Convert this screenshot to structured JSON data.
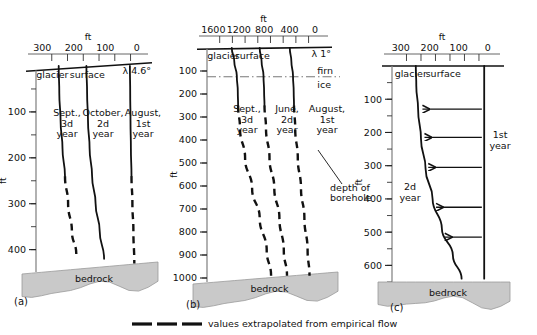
{
  "figure": {
    "legend": {
      "dash_symbol": "— — —",
      "text": "values extrapolated from empirical flow"
    },
    "panels": [
      {
        "id": "a",
        "caption": "(a)",
        "axis_unit_top": "ft",
        "axis_unit_left": "ft",
        "x_ticks": [
          "300",
          "200",
          "100",
          "0"
        ],
        "x_minor_step": 50,
        "y_ticks": [
          "100",
          "200",
          "300",
          "400"
        ],
        "y_minor_step": 50,
        "surface_label_left": "glacier",
        "surface_label_right": "surface",
        "slope_label": "λ 4.6°",
        "bed_label": "bedrock",
        "curves": [
          {
            "name": "curve-3d-year",
            "label_lines": [
              "Sept.,",
              "3d",
              "year"
            ],
            "solid_to_depth": 260,
            "extrapolated": true
          },
          {
            "name": "curve-2d-year",
            "label_lines": [
              "October,",
              "2d",
              "year"
            ],
            "solid_to_depth": 420,
            "extrapolated": false
          },
          {
            "name": "curve-1st-year",
            "label_lines": [
              "August,",
              "1st",
              "year"
            ],
            "solid_to_depth": 240,
            "extrapolated": true
          }
        ]
      },
      {
        "id": "b",
        "caption": "(b)",
        "axis_unit_top": "ft",
        "axis_unit_left": "ft",
        "x_ticks": [
          "1600",
          "1200",
          "800",
          "400",
          "0"
        ],
        "x_minor_step": 200,
        "y_ticks": [
          "100",
          "200",
          "300",
          "400",
          "500",
          "600",
          "700",
          "800",
          "900",
          "1000"
        ],
        "y_minor_step": 100,
        "surface_label_left": "glacier",
        "surface_label_right": "surface",
        "slope_label": "λ 1°",
        "firn_label": "firn",
        "ice_label": "ice",
        "firn_ice_depth": 125,
        "bed_label": "bedrock",
        "annotation": {
          "name": "depth-of-borehole",
          "lines": [
            "depth of",
            "borehole"
          ]
        },
        "curves": [
          {
            "name": "curve-3d-year",
            "label_lines": [
              "Sept.,",
              "3d",
              "year"
            ],
            "solid_to_depth": 250,
            "extrapolated": true
          },
          {
            "name": "curve-2d-year",
            "label_lines": [
              "June,",
              "2d",
              "year"
            ],
            "solid_to_depth": 250,
            "extrapolated": true
          },
          {
            "name": "curve-1st-year",
            "label_lines": [
              "August,",
              "1st",
              "year"
            ],
            "solid_to_depth": 250,
            "extrapolated": true
          }
        ]
      },
      {
        "id": "c",
        "caption": "(c)",
        "axis_unit_top": "ft",
        "axis_unit_left": "ft",
        "x_ticks": [
          "300",
          "200",
          "100",
          "0"
        ],
        "x_minor_step": 50,
        "y_ticks": [
          "100",
          "200",
          "300",
          "400",
          "500",
          "600"
        ],
        "y_minor_step": 50,
        "surface_label_left": "glacier",
        "surface_label_right": "surface",
        "bed_label": "bedrock",
        "arrow_count": 5,
        "curves": [
          {
            "name": "curve-2d-year",
            "label_lines": [
              "2d",
              "year"
            ],
            "solid_to_depth": 650,
            "extrapolated": false
          },
          {
            "name": "curve-1st-year",
            "label_lines": [
              "1st",
              "year"
            ],
            "solid_to_depth": 650,
            "extrapolated": false
          }
        ]
      }
    ]
  },
  "chart_data": {
    "type": "line",
    "title": "",
    "xlabel": "ft",
    "ylabel": "ft",
    "grid": false,
    "legend": "values extrapolated from empirical flow",
    "panels": [
      {
        "panel": "a",
        "xlim": [
          320,
          -10
        ],
        "ylim": [
          0,
          440
        ],
        "xticks": [
          300,
          200,
          100,
          0
        ],
        "yticks": [
          100,
          200,
          300,
          400
        ],
        "surface_slope_deg": 4.6,
        "bed_depth": 440,
        "series": [
          {
            "name": "Sept., 3d year",
            "x": [
              248,
              246,
              242,
              236,
              228,
              218,
              206,
              192
            ],
            "y": [
              0,
              60,
              120,
              180,
              240,
              300,
              360,
              410
            ],
            "dashed_from_y": 260
          },
          {
            "name": "October, 2d year",
            "x": [
              160,
              158,
              155,
              150,
              142,
              131,
              118,
              104
            ],
            "y": [
              0,
              60,
              120,
              180,
              240,
              300,
              360,
              420
            ],
            "dashed_from_y": null
          },
          {
            "name": "August, 1st year",
            "x": [
              22,
              21,
              20,
              19,
              17,
              14,
              11,
              8
            ],
            "y": [
              0,
              60,
              120,
              180,
              240,
              300,
              360,
              430
            ],
            "dashed_from_y": 240
          }
        ]
      },
      {
        "panel": "b",
        "xlim": [
          1700,
          -80
        ],
        "ylim": [
          0,
          1000
        ],
        "xticks": [
          1600,
          1200,
          800,
          400,
          0
        ],
        "yticks": [
          100,
          200,
          300,
          400,
          500,
          600,
          700,
          800,
          900,
          1000
        ],
        "surface_slope_deg": 1.0,
        "firn_ice_boundary_depth": 125,
        "bed_depth": 1000,
        "series": [
          {
            "name": "Sept., 3d year",
            "x": [
              1310,
              1270,
              1230,
              1215,
              1210,
              1180,
              1100,
              990,
              870,
              760,
              690
            ],
            "y": [
              0,
              60,
              120,
              190,
              250,
              350,
              480,
              610,
              740,
              880,
              990
            ],
            "dashed_from_y": 250
          },
          {
            "name": "June, 2d year",
            "x": [
              870,
              840,
              810,
              800,
              795,
              770,
              715,
              640,
              560,
              490,
              440
            ],
            "y": [
              0,
              60,
              120,
              190,
              250,
              350,
              480,
              610,
              740,
              880,
              990
            ],
            "dashed_from_y": 250
          },
          {
            "name": "August, 1st year",
            "x": [
              395,
              370,
              345,
              335,
              330,
              310,
              270,
              220,
              165,
              115,
              85
            ],
            "y": [
              0,
              60,
              120,
              190,
              250,
              350,
              480,
              610,
              740,
              880,
              990
            ],
            "dashed_from_y": 250
          }
        ]
      },
      {
        "panel": "c",
        "xlim": [
          330,
          -15
        ],
        "ylim": [
          0,
          650
        ],
        "xticks": [
          300,
          200,
          100,
          0
        ],
        "yticks": [
          100,
          200,
          300,
          400,
          500,
          600
        ],
        "bed_depth": 650,
        "series": [
          {
            "name": "2d year",
            "x": [
              248,
              246,
              240,
              230,
              214,
              190,
              158,
              120,
              90
            ],
            "y": [
              0,
              60,
              130,
              220,
              310,
              400,
              490,
              570,
              640
            ],
            "dashed_from_y": null
          },
          {
            "name": "1st year",
            "x": [
              12,
              12,
              12,
              12,
              12,
              12,
              12,
              12,
              12
            ],
            "y": [
              0,
              60,
              130,
              220,
              310,
              400,
              490,
              570,
              640
            ],
            "dashed_from_y": null
          }
        ],
        "velocity_arrows": [
          {
            "depth": 130,
            "from_x": 20,
            "to_x": 225
          },
          {
            "depth": 215,
            "from_x": 20,
            "to_x": 218
          },
          {
            "depth": 305,
            "from_x": 20,
            "to_x": 205
          },
          {
            "depth": 425,
            "from_x": 20,
            "to_x": 178
          },
          {
            "depth": 515,
            "from_x": 20,
            "to_x": 148
          }
        ]
      }
    ]
  }
}
